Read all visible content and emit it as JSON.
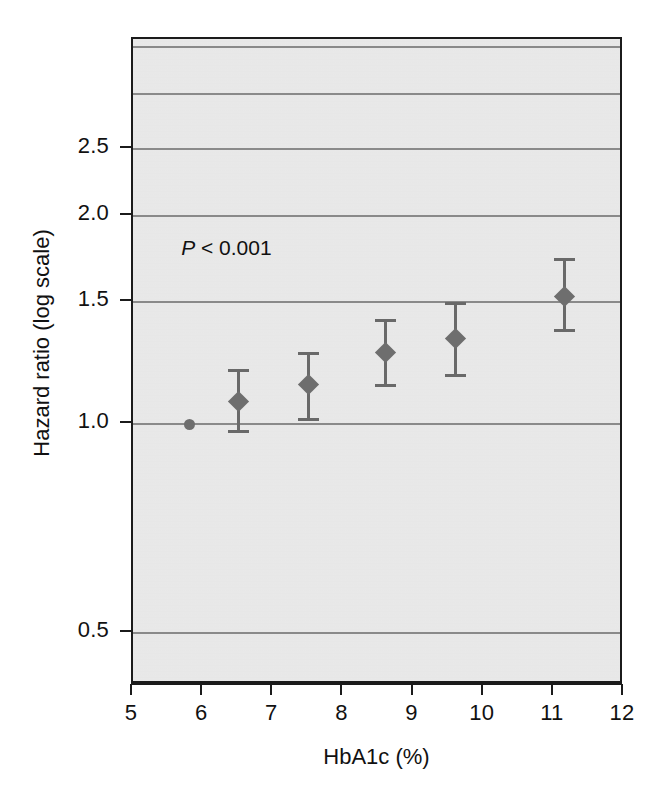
{
  "chart_data": {
    "type": "scatter",
    "title": "",
    "subtitle": "",
    "xlabel": "HbA1c (%)",
    "ylabel": "Hazard ratio (log scale)",
    "yscale": "log",
    "xlim": [
      5,
      12
    ],
    "ylim": [
      0.42,
      3.6
    ],
    "grid": true,
    "legend": false,
    "annotations": [
      {
        "name": "p-value",
        "text_italic": "P",
        "text_rest": " < 0.001",
        "text": "P < 0.001",
        "x": 6.0,
        "y": 1.78
      }
    ],
    "x_ticks": [
      5,
      6,
      7,
      8,
      9,
      10,
      11,
      12
    ],
    "x_tick_labels": [
      "5",
      "6",
      "7",
      "8",
      "9",
      "10",
      "11",
      "12"
    ],
    "y_ticks": [
      0.5,
      1.0,
      1.5,
      2.0,
      2.5
    ],
    "y_tick_labels": [
      "0.5",
      "1.0",
      "1.5",
      "2.0",
      "2.5"
    ],
    "gridline_values": [
      0.5,
      1.0,
      1.5,
      2.0,
      2.5,
      3.0,
      3.5
    ],
    "series": [
      {
        "name": "Hazard ratio by HbA1c category",
        "marker": "diamond",
        "reference_marker": "circle",
        "points": [
          {
            "x": 5.8,
            "y": 1.0,
            "lower": 1.0,
            "upper": 1.0,
            "reference": true
          },
          {
            "x": 6.5,
            "y": 1.08,
            "lower": 0.97,
            "upper": 1.2,
            "reference": false
          },
          {
            "x": 7.5,
            "y": 1.14,
            "lower": 1.01,
            "upper": 1.27,
            "reference": false
          },
          {
            "x": 8.6,
            "y": 1.27,
            "lower": 1.13,
            "upper": 1.42,
            "reference": false
          },
          {
            "x": 9.6,
            "y": 1.33,
            "lower": 1.17,
            "upper": 1.5,
            "reference": false
          },
          {
            "x": 11.15,
            "y": 1.53,
            "lower": 1.36,
            "upper": 1.74,
            "reference": false
          }
        ]
      }
    ],
    "colors": {
      "plot_background": "#ececec",
      "frame": "#1b1b1b",
      "gridline": "#8a8a8a",
      "marker": "#6e6e6e",
      "errorbar": "#696969",
      "text": "#111111",
      "page_background": "#ffffff"
    }
  }
}
